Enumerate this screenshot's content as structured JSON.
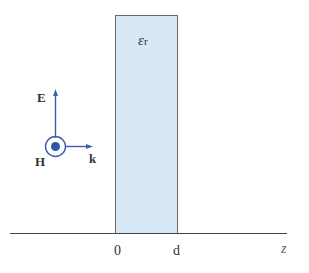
{
  "diagram": {
    "slab_label": "ε",
    "slab_label_sub": "r",
    "e_field_label": "E",
    "h_field_label": "H",
    "k_label": "k",
    "axis_label": "z",
    "tick_0": "0",
    "tick_d": "d",
    "colors": {
      "slab_fill": "#d6e8f5",
      "slab_stroke": "#666666",
      "vector": "#3a5fb0",
      "axis": "#444444"
    }
  }
}
